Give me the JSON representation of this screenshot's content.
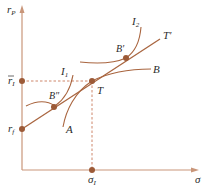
{
  "figure": {
    "colors": {
      "axis": "#c9967a",
      "curve": "#a9653f",
      "point": "#9c5a37",
      "dashed": "#c8785a",
      "text": "#2b2b2b"
    },
    "axes": {
      "y_label": "r",
      "y_label_sub": "P",
      "x_label": "σ"
    },
    "points": {
      "r_bar_I": {
        "label": "r",
        "sub": "I",
        "overbar": true
      },
      "r_f": {
        "label": "r",
        "sub": "f"
      },
      "sigma_I": {
        "label": "σ",
        "sub": "I"
      },
      "T": {
        "label": "T"
      },
      "B_double_prime": {
        "label": "B″"
      },
      "B_prime": {
        "label": "B′"
      }
    },
    "curves": {
      "A": {
        "label": "A"
      },
      "B": {
        "label": "B"
      },
      "I1": {
        "label": "I",
        "sub": "1"
      },
      "I2": {
        "label": "I",
        "sub": "2"
      },
      "T_prime": {
        "label": "T′"
      }
    }
  }
}
